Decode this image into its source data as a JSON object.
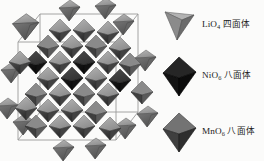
{
  "figure": {
    "type": "crystal-structure-diagram",
    "background_color": "#fbfbfa",
    "description_alt": "Spinel crystal structure with unit cell outline, tetrahedra and octahedra"
  },
  "structure": {
    "name": "spinel-unit-cell",
    "cell_line_color": "#8d8d8d",
    "polyhedra_palette": {
      "light_gray": "#a6a6a6",
      "mid_gray": "#7d7d7d",
      "dark_gray": "#555555",
      "near_black": "#1e1e1e",
      "highlight": "#c9c9c9",
      "shadow": "#3a3a3a"
    }
  },
  "legend": {
    "items": [
      {
        "glyph": "tetrahedron-icon",
        "formula_element": "LiO",
        "formula_subscript": "4",
        "shape_cn": "四面体",
        "shape_en": "tetrahedron",
        "color_top": "#b0b0b0",
        "color_left": "#8a8a8a",
        "color_right": "#676767",
        "edge_color": "#5a5a5a"
      },
      {
        "glyph": "octahedron-icon",
        "formula_element": "NiO",
        "formula_subscript": "6",
        "shape_cn": "八面体",
        "shape_en": "octahedron",
        "color_top": "#262626",
        "color_left": "#141414",
        "color_right": "#0d0d0d",
        "edge_color": "#000000"
      },
      {
        "glyph": "octahedron-icon",
        "formula_element": "MnO",
        "formula_subscript": "6",
        "shape_cn": "八面体",
        "shape_en": "octahedron",
        "color_top": "#6f6f6f",
        "color_left": "#4a4a4a",
        "color_right": "#3a3a3a",
        "edge_color": "#2b2b2b"
      }
    ]
  }
}
